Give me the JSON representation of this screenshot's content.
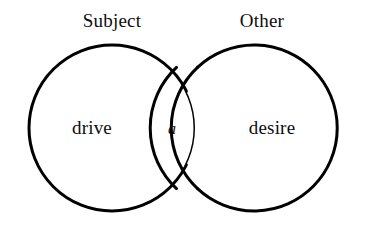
{
  "figure": {
    "type": "venn-diagram",
    "title": "",
    "background_color": "#ffffff",
    "stroke_color": "#000000",
    "text_color": "#0d0d0d"
  },
  "labels": {
    "subject": "Subject",
    "other": "Other",
    "drive": "drive",
    "desire": "desire",
    "objet_a": "a"
  },
  "geometry": {
    "left_circle": {
      "cx": 112,
      "cy": 128,
      "r": 83
    },
    "right_circle": {
      "cx": 262,
      "cy": 128,
      "r": 83
    },
    "stroke_width": 3
  }
}
